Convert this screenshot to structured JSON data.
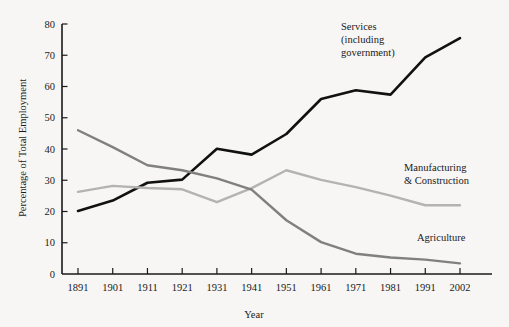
{
  "chart_data": {
    "type": "line",
    "title": "",
    "xlabel": "Year",
    "ylabel": "Percentage of Total Employment",
    "categories": [
      "1891",
      "1901",
      "1911",
      "1921",
      "1931",
      "1941",
      "1951",
      "1961",
      "1971",
      "1981",
      "1991",
      "2002"
    ],
    "xlim": [
      0,
      11
    ],
    "ylim": [
      0,
      80
    ],
    "yticks": [
      "0",
      "10",
      "20",
      "30",
      "40",
      "50",
      "60",
      "70",
      "80"
    ],
    "grid": false,
    "legend_position": "inline-annotations",
    "series": [
      {
        "name": "Services (including government)",
        "color": "#111111",
        "values": [
          20.2,
          23.5,
          29.2,
          30.2,
          40.1,
          38.2,
          44.8,
          56.0,
          58.8,
          57.4,
          69.3,
          75.5
        ]
      },
      {
        "name": "Manufacturing & Construction",
        "color": "#b3b3b3",
        "values": [
          26.3,
          28.2,
          27.5,
          27.1,
          23.0,
          27.5,
          33.2,
          30.1,
          27.8,
          25.1,
          22.0,
          22.0
        ]
      },
      {
        "name": "Agriculture",
        "color": "#808080",
        "values": [
          46.0,
          40.6,
          34.8,
          33.2,
          30.6,
          27.0,
          17.2,
          10.2,
          6.5,
          5.3,
          4.6,
          3.4
        ]
      }
    ],
    "annotations": [
      {
        "id": "services-annotation",
        "lines": [
          "Services",
          "(including",
          "government)"
        ],
        "x": 341,
        "y": 30
      },
      {
        "id": "manufacturing-annotation",
        "lines": [
          "Manufacturing",
          "& Construction"
        ],
        "x": 404,
        "y": 171
      },
      {
        "id": "agriculture-annotation",
        "lines": [
          "Agriculture"
        ],
        "x": 417,
        "y": 241
      }
    ]
  },
  "axes": {
    "y_title": "Percentage of Total Employment",
    "x_title": "Year"
  }
}
